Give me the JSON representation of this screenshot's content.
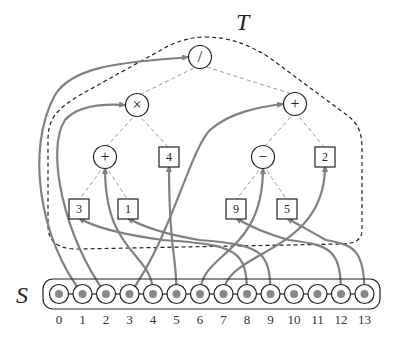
{
  "diagram": {
    "tree_label": "T",
    "sequence_label": "S",
    "colors": {
      "edge": "#888888",
      "arrow": "#808080",
      "stroke": "#222222",
      "node_dot": "#888888",
      "boundary": "#222222"
    },
    "tree_nodes": [
      {
        "id": "div",
        "type": "op",
        "label": "/",
        "x": 200,
        "y": 57
      },
      {
        "id": "mul",
        "type": "op",
        "label": "×",
        "x": 137,
        "y": 105
      },
      {
        "id": "add_r",
        "type": "op",
        "label": "+",
        "x": 295,
        "y": 104
      },
      {
        "id": "add_l",
        "type": "op",
        "label": "+",
        "x": 105,
        "y": 157
      },
      {
        "id": "four",
        "type": "leaf",
        "label": "4",
        "x": 169,
        "y": 157
      },
      {
        "id": "minus",
        "type": "op",
        "label": "−",
        "x": 263,
        "y": 157
      },
      {
        "id": "two",
        "type": "leaf",
        "label": "2",
        "x": 325,
        "y": 157
      },
      {
        "id": "three",
        "type": "leaf",
        "label": "3",
        "x": 79,
        "y": 209
      },
      {
        "id": "one",
        "type": "leaf",
        "label": "1",
        "x": 128,
        "y": 209
      },
      {
        "id": "nine",
        "type": "leaf",
        "label": "9",
        "x": 236,
        "y": 209
      },
      {
        "id": "five",
        "type": "leaf",
        "label": "5",
        "x": 287,
        "y": 209
      }
    ],
    "tree_edges": [
      [
        "div",
        "mul"
      ],
      [
        "div",
        "add_r"
      ],
      [
        "mul",
        "add_l"
      ],
      [
        "mul",
        "four"
      ],
      [
        "add_r",
        "minus"
      ],
      [
        "add_r",
        "two"
      ],
      [
        "add_l",
        "three"
      ],
      [
        "add_l",
        "one"
      ],
      [
        "minus",
        "nine"
      ],
      [
        "minus",
        "five"
      ]
    ],
    "sequence_indices": [
      "0",
      "1",
      "2",
      "3",
      "4",
      "5",
      "6",
      "7",
      "8",
      "9",
      "10",
      "11",
      "12",
      "13"
    ],
    "mapping": [
      {
        "from": 1,
        "to": "div"
      },
      {
        "from": 2,
        "to": "mul"
      },
      {
        "from": 3,
        "to": "add_r"
      },
      {
        "from": 4,
        "to": "add_l"
      },
      {
        "from": 5,
        "to": "four"
      },
      {
        "from": 6,
        "to": "minus"
      },
      {
        "from": 7,
        "to": "two"
      },
      {
        "from": 8,
        "to": "three"
      },
      {
        "from": 9,
        "to": "one"
      },
      {
        "from": 12,
        "to": "nine"
      },
      {
        "from": 13,
        "to": "five"
      }
    ]
  }
}
